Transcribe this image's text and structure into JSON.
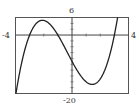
{
  "chart_data": {
    "type": "line",
    "title": "",
    "xlabel": "",
    "ylabel": "",
    "xlim": [
      -4,
      4
    ],
    "ylim": [
      -20,
      6
    ],
    "x_tick_step": 1,
    "y_tick_step": 2,
    "grid": false,
    "labels": {
      "xmin": "-4",
      "xmax": "4",
      "ymax": "6",
      "ymin": "-20"
    },
    "series": [
      {
        "name": "f(x) = x^3 + x^2 - 9x - 9",
        "x": [
          -4,
          -3.5,
          -3,
          -2.5,
          -2,
          -1.5,
          -1,
          -0.5,
          0,
          0.5,
          1,
          1.5,
          2,
          2.5,
          3,
          3.5,
          3.65
        ],
        "values": [
          -21,
          -6.1,
          0,
          4.1,
          5,
          3.4,
          0,
          -4.4,
          -9,
          -13.1,
          -16,
          -16.9,
          -15,
          -9.6,
          0,
          15.1,
          20.7
        ]
      }
    ],
    "annotations": [
      "roots near x = -3, -1, 3",
      "local max ≈ (-2.1, 5.1)",
      "local min ≈ (1.4, -16.9)"
    ]
  },
  "colors": {
    "curve": "#222222",
    "frame": "#555555",
    "axis": "#444444",
    "background": "#ffffff"
  }
}
